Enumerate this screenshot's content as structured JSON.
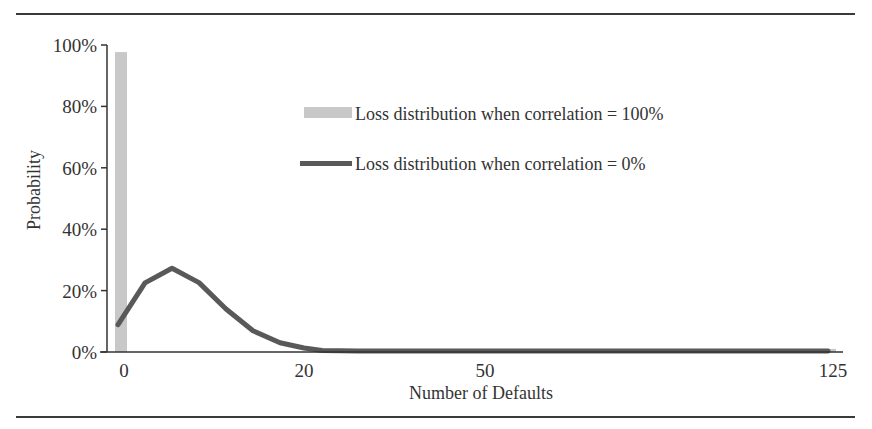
{
  "figure": {
    "title": ""
  },
  "chart_data": {
    "type": "bar+line",
    "title": "",
    "xlabel": "Number of Defaults",
    "ylabel": "Probability",
    "ylim": [
      0,
      100
    ],
    "y_ticks": [
      "0%",
      "20%",
      "40%",
      "60%",
      "80%",
      "100%"
    ],
    "x_tick_labels": [
      {
        "label": "0",
        "value": 0,
        "px": 124
      },
      {
        "label": "20",
        "value": 20,
        "px": 304
      },
      {
        "label": "50",
        "value": 50,
        "px": 485
      },
      {
        "label": "125",
        "value": 125,
        "px": 833
      }
    ],
    "grid": false,
    "legend_position": "upper-center-right",
    "series": [
      {
        "name": "Loss distribution when correlation = 100%",
        "kind": "bar",
        "color": "#c8c8c8",
        "points": [
          {
            "x": 0,
            "y": 97.7
          },
          {
            "x": 125,
            "y": 1.0
          }
        ]
      },
      {
        "name": "Loss distribution when correlation = 0%",
        "kind": "line",
        "color": "#595959",
        "points": [
          {
            "x": 0,
            "y": 8.9
          },
          {
            "x": 3,
            "y": 22.5
          },
          {
            "x": 6,
            "y": 27.3
          },
          {
            "x": 9,
            "y": 22.6
          },
          {
            "x": 12,
            "y": 14.0
          },
          {
            "x": 15,
            "y": 6.9
          },
          {
            "x": 18,
            "y": 3.0
          },
          {
            "x": 21,
            "y": 1.3
          },
          {
            "x": 24,
            "y": 0.5
          },
          {
            "x": 30,
            "y": 0.3
          },
          {
            "x": 50,
            "y": 0.3
          },
          {
            "x": 125,
            "y": 0.3
          }
        ]
      }
    ]
  }
}
